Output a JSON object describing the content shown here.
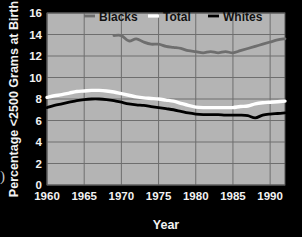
{
  "chart_data": {
    "type": "line",
    "title": "",
    "xlabel": "Year",
    "ylabel": "Percentage <2500 Grams at Birth",
    "xlim": [
      1960,
      1992
    ],
    "ylim": [
      0,
      16
    ],
    "xticks": [
      1960,
      1965,
      1970,
      1975,
      1980,
      1985,
      1990
    ],
    "yticks": [
      0,
      2,
      4,
      6,
      8,
      10,
      12,
      14,
      16
    ],
    "grid": true,
    "legend_position": "top-inside",
    "plot_background": "#b4b4b4",
    "figure_background": "#000000",
    "grid_color": "#6e6e6e",
    "series": [
      {
        "name": "Blacks",
        "color": "#6e6e6e",
        "x": [
          1969,
          1970,
          1971,
          1972,
          1973,
          1974,
          1975,
          1976,
          1977,
          1978,
          1979,
          1980,
          1981,
          1982,
          1983,
          1984,
          1985,
          1986,
          1987,
          1988,
          1989,
          1990,
          1991,
          1992
        ],
        "values": [
          13.9,
          13.9,
          13.4,
          13.6,
          13.3,
          13.1,
          13.1,
          12.9,
          12.8,
          12.7,
          12.5,
          12.4,
          12.3,
          12.4,
          12.3,
          12.4,
          12.3,
          12.5,
          12.7,
          12.9,
          13.1,
          13.3,
          13.5,
          13.6
        ]
      },
      {
        "name": "Total",
        "color": "#ffffff",
        "x": [
          1960,
          1961,
          1962,
          1963,
          1964,
          1965,
          1966,
          1967,
          1968,
          1969,
          1970,
          1971,
          1972,
          1973,
          1974,
          1975,
          1976,
          1977,
          1978,
          1979,
          1980,
          1981,
          1982,
          1983,
          1984,
          1985,
          1986,
          1987,
          1988,
          1989,
          1990,
          1991,
          1992
        ],
        "values": [
          8.15,
          8.3,
          8.4,
          8.55,
          8.7,
          8.75,
          8.8,
          8.8,
          8.75,
          8.65,
          8.5,
          8.35,
          8.2,
          8.1,
          8.05,
          8.0,
          7.9,
          7.8,
          7.6,
          7.4,
          7.25,
          7.2,
          7.2,
          7.2,
          7.2,
          7.2,
          7.3,
          7.35,
          7.55,
          7.65,
          7.7,
          7.75,
          7.8
        ]
      },
      {
        "name": "Whites",
        "color": "#000000",
        "x": [
          1960,
          1961,
          1962,
          1963,
          1964,
          1965,
          1966,
          1967,
          1968,
          1969,
          1970,
          1971,
          1972,
          1973,
          1974,
          1975,
          1976,
          1977,
          1978,
          1979,
          1980,
          1981,
          1982,
          1983,
          1984,
          1985,
          1986,
          1987,
          1988,
          1989,
          1990,
          1991,
          1992
        ],
        "values": [
          7.2,
          7.4,
          7.55,
          7.7,
          7.85,
          7.95,
          8.0,
          8.0,
          7.95,
          7.85,
          7.7,
          7.55,
          7.45,
          7.4,
          7.3,
          7.2,
          7.1,
          7.0,
          6.85,
          6.7,
          6.6,
          6.55,
          6.55,
          6.55,
          6.5,
          6.5,
          6.5,
          6.45,
          6.25,
          6.5,
          6.6,
          6.65,
          6.7
        ]
      }
    ]
  },
  "legend": {
    "items": [
      {
        "label": "Blacks",
        "color": "#6e6e6e"
      },
      {
        "label": "Total",
        "color": "#ffffff"
      },
      {
        "label": "Whites",
        "color": "#000000"
      }
    ]
  },
  "axes": {
    "y_title": "Percentage <2500 Grams at Birth",
    "x_title": "Year",
    "y_tick_labels": [
      "16",
      "14",
      "12",
      "10",
      "8",
      "6",
      "4",
      "2",
      "0"
    ],
    "x_tick_labels": [
      "1960",
      "1965",
      "1970",
      "1975",
      "1980",
      "1985",
      "1990"
    ]
  },
  "artifact": {
    "edge_glyph": ")"
  }
}
